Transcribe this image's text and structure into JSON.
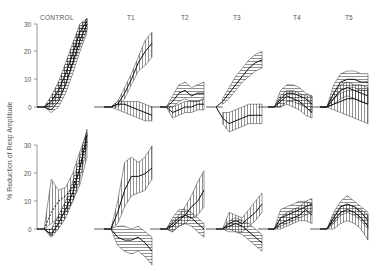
{
  "chart_data": {
    "type": "area",
    "title": "",
    "ylabel": "% Reduction of Resp Amplitude",
    "xlabel": "",
    "ylim": [
      0,
      30
    ],
    "yticks": [
      0,
      10,
      20,
      30
    ],
    "grid": false,
    "legend": null,
    "layout": {
      "rows": 2,
      "columns": 6
    },
    "column_labels": [
      "CONTROL",
      "T1",
      "T2",
      "T3",
      "T4",
      "T5"
    ],
    "note": "Each panel shows a flat pre-stimulus baseline at 0 followed by time courses of mean % reduction (dark line) with hatched variability bands; x-axis is unlabeled time points (approx. 7 steps per panel).",
    "panels": [
      {
        "row": 1,
        "column": "CONTROL",
        "series": [
          {
            "name": "band-1",
            "hatch": "cross",
            "mean": [
              0,
              0,
              2,
              6,
              12,
              19,
              27,
              31
            ],
            "lower": [
              0,
              0,
              0,
              3,
              8,
              15,
              22,
              28
            ],
            "upper": [
              0,
              0,
              4,
              9,
              16,
              23,
              30,
              32
            ]
          },
          {
            "name": "band-2",
            "hatch": "horizontal",
            "mean": [
              0,
              0,
              -1,
              2,
              8,
              16,
              24,
              30
            ],
            "lower": [
              0,
              0,
              -2,
              0,
              5,
              12,
              20,
              27
            ],
            "upper": [
              0,
              0,
              1,
              5,
              12,
              20,
              28,
              32
            ]
          }
        ]
      },
      {
        "row": 1,
        "column": "T1",
        "series": [
          {
            "name": "rising",
            "hatch": "vertical",
            "mean": [
              0,
              0,
              1,
              5,
              10,
              16,
              20,
              23
            ],
            "lower": [
              0,
              0,
              0,
              3,
              8,
              13,
              15,
              18
            ],
            "upper": [
              0,
              0,
              2,
              7,
              12,
              18,
              24,
              27
            ]
          },
          {
            "name": "flat-neg",
            "hatch": "vertical",
            "mean": [
              0,
              0,
              1,
              1,
              0,
              -1,
              -2,
              -3
            ],
            "lower": [
              0,
              0,
              -1,
              -2,
              -3,
              -4,
              -5,
              -5
            ],
            "upper": [
              0,
              0,
              2,
              2,
              2,
              2,
              1,
              0
            ]
          }
        ]
      },
      {
        "row": 1,
        "column": "T2",
        "series": [
          {
            "name": "upper",
            "hatch": "horizontal",
            "mean": [
              0,
              0,
              2,
              5,
              6,
              4,
              5,
              5
            ],
            "lower": [
              0,
              0,
              0,
              2,
              3,
              2,
              2,
              3
            ],
            "upper": [
              0,
              0,
              4,
              8,
              9,
              7,
              8,
              9
            ]
          },
          {
            "name": "lower",
            "hatch": "vertical",
            "mean": [
              0,
              0,
              -2,
              -1,
              0,
              0,
              1,
              1
            ],
            "lower": [
              0,
              0,
              -4,
              -3,
              -2,
              -2,
              -1,
              -1
            ],
            "upper": [
              0,
              0,
              0,
              1,
              2,
              2,
              2,
              3
            ]
          }
        ]
      },
      {
        "row": 1,
        "column": "T3",
        "series": [
          {
            "name": "rising",
            "hatch": "horizontal",
            "mean": [
              0,
              2,
              5,
              8,
              11,
              14,
              16,
              17
            ],
            "lower": [
              0,
              1,
              3,
              6,
              9,
              11,
              13,
              14
            ],
            "upper": [
              0,
              3,
              7,
              11,
              14,
              17,
              19,
              20
            ]
          },
          {
            "name": "negative",
            "hatch": "vertical",
            "mean": [
              0,
              -4,
              -6,
              -5,
              -4,
              -3,
              -3,
              -3
            ],
            "lower": [
              0,
              -6,
              -9,
              -8,
              -7,
              -6,
              -6,
              -6
            ],
            "upper": [
              0,
              -2,
              -2,
              -1,
              0,
              1,
              1,
              1
            ]
          }
        ]
      },
      {
        "row": 1,
        "column": "T4",
        "series": [
          {
            "name": "band-1",
            "hatch": "horizontal",
            "mean": [
              0,
              0,
              3,
              5,
              5,
              4,
              3,
              1
            ],
            "lower": [
              0,
              0,
              0,
              2,
              2,
              1,
              0,
              -2
            ],
            "upper": [
              0,
              0,
              6,
              8,
              8,
              7,
              5,
              4
            ]
          },
          {
            "name": "band-2",
            "hatch": "vertical",
            "mean": [
              0,
              0,
              2,
              4,
              3,
              2,
              0,
              -2
            ],
            "lower": [
              0,
              0,
              0,
              1,
              0,
              -1,
              -3,
              -4
            ],
            "upper": [
              0,
              0,
              4,
              6,
              6,
              5,
              4,
              4
            ]
          }
        ]
      },
      {
        "row": 1,
        "column": "T5",
        "series": [
          {
            "name": "top",
            "hatch": "horizontal",
            "mean": [
              0,
              0,
              5,
              9,
              10,
              10,
              9,
              9
            ],
            "lower": [
              0,
              0,
              3,
              6,
              7,
              7,
              6,
              6
            ],
            "upper": [
              0,
              0,
              8,
              12,
              13,
              13,
              12,
              12
            ]
          },
          {
            "name": "middle",
            "hatch": "vertical",
            "mean": [
              0,
              0,
              3,
              6,
              7,
              6,
              5,
              4
            ],
            "lower": [
              0,
              0,
              1,
              3,
              4,
              3,
              2,
              1
            ],
            "upper": [
              0,
              0,
              5,
              8,
              9,
              8,
              8,
              7
            ]
          },
          {
            "name": "bottom",
            "hatch": "vertical",
            "mean": [
              0,
              0,
              1,
              2,
              3,
              3,
              2,
              1
            ],
            "lower": [
              0,
              0,
              -1,
              -2,
              -3,
              -4,
              -5,
              -6
            ],
            "upper": [
              0,
              0,
              3,
              5,
              6,
              6,
              6,
              6
            ]
          }
        ]
      },
      {
        "row": 2,
        "column": "CONTROL",
        "series": [
          {
            "name": "dashed-early",
            "hatch": "vertical",
            "mean": [
              0,
              0,
              6,
              10,
              12,
              15,
              22,
              32
            ],
            "lower": [
              0,
              0,
              2,
              4,
              6,
              10,
              16,
              26
            ],
            "upper": [
              0,
              0,
              18,
              14,
              15,
              20,
              28,
              35
            ]
          },
          {
            "name": "cross",
            "hatch": "cross",
            "mean": [
              0,
              0,
              -2,
              2,
              7,
              13,
              22,
              34
            ],
            "lower": [
              0,
              0,
              -3,
              0,
              4,
              10,
              18,
              30
            ],
            "upper": [
              0,
              0,
              0,
              5,
              10,
              17,
              26,
              36
            ]
          }
        ]
      },
      {
        "row": 2,
        "column": "T1",
        "series": [
          {
            "name": "rising",
            "hatch": "vertical",
            "mean": [
              0,
              0,
              6,
              14,
              19,
              19,
              20,
              22
            ],
            "lower": [
              0,
              0,
              2,
              8,
              12,
              13,
              14,
              18
            ],
            "upper": [
              0,
              0,
              10,
              24,
              26,
              24,
              26,
              30
            ]
          },
          {
            "name": "falling",
            "hatch": "horizontal",
            "mean": [
              0,
              0,
              -3,
              -4,
              -4,
              -3,
              -5,
              -8
            ],
            "lower": [
              0,
              0,
              -6,
              -8,
              -9,
              -8,
              -10,
              -13
            ],
            "upper": [
              0,
              0,
              1,
              1,
              0,
              1,
              -1,
              -3
            ]
          }
        ]
      },
      {
        "row": 2,
        "column": "T2",
        "series": [
          {
            "name": "rising",
            "hatch": "vertical",
            "mean": [
              0,
              0,
              1,
              3,
              5,
              8,
              10,
              14
            ],
            "lower": [
              0,
              0,
              -1,
              1,
              2,
              4,
              5,
              8
            ],
            "upper": [
              0,
              0,
              3,
              5,
              8,
              12,
              17,
              21
            ]
          },
          {
            "name": "crossing",
            "hatch": "horizontal",
            "mean": [
              0,
              0,
              2,
              4,
              5,
              4,
              2,
              0
            ],
            "lower": [
              0,
              0,
              -1,
              1,
              2,
              1,
              -1,
              -3
            ],
            "upper": [
              0,
              0,
              4,
              7,
              7,
              6,
              4,
              2
            ]
          }
        ]
      },
      {
        "row": 2,
        "column": "T3",
        "series": [
          {
            "name": "rising",
            "hatch": "vertical",
            "mean": [
              0,
              0,
              2,
              3,
              2,
              4,
              6,
              9
            ],
            "lower": [
              0,
              0,
              0,
              -1,
              -1,
              1,
              3,
              6
            ],
            "upper": [
              0,
              0,
              6,
              5,
              4,
              7,
              10,
              13
            ]
          },
          {
            "name": "falling",
            "hatch": "horizontal",
            "mean": [
              0,
              0,
              1,
              2,
              1,
              -1,
              -3,
              -5
            ],
            "lower": [
              0,
              0,
              -1,
              -1,
              -2,
              -4,
              -6,
              -8
            ],
            "upper": [
              0,
              0,
              3,
              4,
              3,
              2,
              0,
              -2
            ]
          }
        ]
      },
      {
        "row": 2,
        "column": "T4",
        "series": [
          {
            "name": "band-1",
            "hatch": "horizontal",
            "mean": [
              0,
              0,
              4,
              5,
              6,
              7,
              8,
              9
            ],
            "lower": [
              0,
              0,
              1,
              2,
              3,
              4,
              5,
              6
            ],
            "upper": [
              0,
              0,
              7,
              8,
              9,
              10,
              10,
              11
            ]
          },
          {
            "name": "band-2",
            "hatch": "vertical",
            "mean": [
              0,
              0,
              2,
              3,
              4,
              5,
              7,
              5
            ],
            "lower": [
              0,
              0,
              0,
              1,
              2,
              3,
              3,
              2
            ],
            "upper": [
              0,
              0,
              4,
              6,
              7,
              8,
              10,
              9
            ]
          }
        ]
      },
      {
        "row": 2,
        "column": "T5",
        "series": [
          {
            "name": "top",
            "hatch": "horizontal",
            "mean": [
              0,
              0,
              4,
              8,
              9,
              8,
              6,
              3
            ],
            "lower": [
              0,
              0,
              2,
              5,
              6,
              5,
              3,
              0
            ],
            "upper": [
              0,
              0,
              6,
              10,
              12,
              10,
              8,
              6
            ]
          },
          {
            "name": "inner",
            "hatch": "vertical",
            "mean": [
              0,
              0,
              3,
              6,
              7,
              6,
              4,
              1
            ],
            "lower": [
              0,
              0,
              0,
              2,
              3,
              2,
              0,
              -4
            ],
            "upper": [
              0,
              0,
              5,
              8,
              9,
              8,
              7,
              5
            ]
          }
        ]
      }
    ]
  },
  "axes": {
    "ylabel": "% Reduction of Resp Amplitude",
    "top_row_ticks": [
      "0",
      "10",
      "20",
      "30"
    ],
    "bottom_row_ticks": [
      "0",
      "10",
      "20",
      "30"
    ]
  },
  "headers": [
    "CONTROL",
    "T1",
    "T2",
    "T3",
    "T4",
    "T5"
  ]
}
